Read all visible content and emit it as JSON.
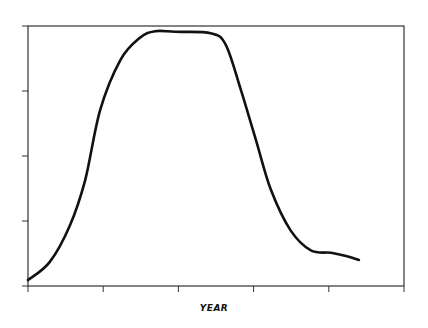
{
  "chart_data": {
    "type": "line",
    "title": "",
    "xlabel": "YEAR",
    "ylabel": "",
    "x_ticks": [
      0,
      1,
      2,
      3,
      4,
      5
    ],
    "x_tick_labels": [],
    "y_ticks": [
      0,
      1,
      2,
      3,
      4
    ],
    "y_tick_labels": [],
    "xlim": [
      0,
      5
    ],
    "ylim": [
      0,
      4
    ],
    "grid": false,
    "legend": null,
    "series": [
      {
        "name": "curve",
        "color": "#111111",
        "x": [
          0.0,
          0.29,
          0.56,
          0.76,
          0.96,
          1.23,
          1.49,
          1.69,
          1.96,
          2.43,
          2.63,
          2.83,
          3.03,
          3.23,
          3.49,
          3.76,
          4.03,
          4.23,
          4.4
        ],
        "y": [
          0.09,
          0.37,
          0.94,
          1.63,
          2.71,
          3.48,
          3.82,
          3.92,
          3.91,
          3.89,
          3.71,
          3.02,
          2.25,
          1.48,
          0.86,
          0.55,
          0.51,
          0.46,
          0.4
        ]
      }
    ]
  },
  "axes": {
    "xlabel": "YEAR"
  }
}
